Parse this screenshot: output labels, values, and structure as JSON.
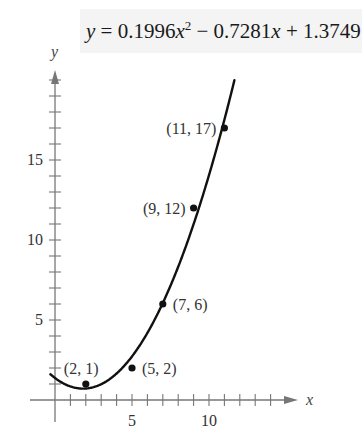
{
  "equation": {
    "lhs": "y",
    "eq": " = 0.1996",
    "var1": "x",
    "exp": "2",
    "mid": " − 0.7281",
    "var2": "x",
    "tail": " + 1.3749"
  },
  "axes": {
    "x_label": "x",
    "y_label": "y",
    "x_ticks_labeled": [
      "5",
      "10"
    ],
    "y_ticks_labeled": [
      "5",
      "10",
      "15"
    ]
  },
  "points": [
    {
      "label": "(2, 1)",
      "x": 2,
      "y": 1
    },
    {
      "label": "(5, 2)",
      "x": 5,
      "y": 2
    },
    {
      "label": "(7, 6)",
      "x": 7,
      "y": 6
    },
    {
      "label": "(9, 12)",
      "x": 9,
      "y": 12
    },
    {
      "label": "(11, 17)",
      "x": 11,
      "y": 17
    }
  ],
  "chart_data": {
    "type": "scatter",
    "xlabel": "x",
    "ylabel": "y",
    "xlim": [
      -1.5,
      15.5
    ],
    "ylim": [
      -1.4,
      20.5
    ],
    "x_ticks": [
      1,
      2,
      3,
      4,
      5,
      6,
      7,
      8,
      9,
      10,
      11,
      12,
      13,
      14
    ],
    "x_tick_labels": {
      "5": "5",
      "10": "10"
    },
    "y_ticks": [
      1,
      2,
      3,
      4,
      5,
      6,
      7,
      8,
      9,
      10,
      11,
      12,
      13,
      14,
      15,
      16,
      17,
      18,
      19,
      20
    ],
    "y_tick_labels": {
      "5": "5",
      "10": "10",
      "15": "15"
    },
    "grid": false,
    "series": [
      {
        "name": "data points",
        "type": "scatter",
        "x": [
          2,
          5,
          7,
          9,
          11
        ],
        "y": [
          1,
          2,
          6,
          12,
          17
        ],
        "labels": [
          "(2, 1)",
          "(5, 2)",
          "(7, 6)",
          "(9, 12)",
          "(11, 17)"
        ]
      },
      {
        "name": "quadratic fit",
        "type": "line",
        "equation": {
          "a": 0.1996,
          "b": -0.7281,
          "c": 1.3749
        },
        "x_range": [
          -0.3,
          11.65
        ]
      }
    ]
  }
}
